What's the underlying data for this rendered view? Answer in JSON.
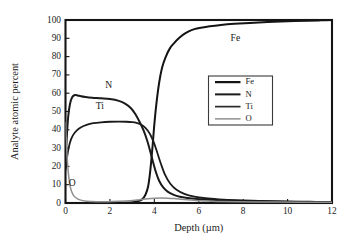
{
  "chart_data": {
    "type": "line",
    "title": "",
    "xlabel": "Depth (µm)",
    "ylabel": "Analyte atomic percent",
    "xlim": [
      0,
      12
    ],
    "ylim": [
      0,
      100
    ],
    "xticks": [
      0,
      2,
      4,
      6,
      8,
      10,
      12
    ],
    "yticks": [
      0,
      10,
      20,
      30,
      40,
      50,
      60,
      70,
      80,
      90,
      100
    ],
    "xtick_labels": [
      "0",
      "2",
      "4",
      "6",
      "8",
      "10",
      "12"
    ],
    "ytick_labels": [
      "0",
      "10",
      "20",
      "30",
      "40",
      "50",
      "60",
      "70",
      "80",
      "90",
      "100"
    ],
    "grid": false,
    "legend_position": "center-right",
    "legend_entries": [
      "Fe",
      "N",
      "Ti",
      "O"
    ],
    "annotations": [
      {
        "text": "Fe",
        "x": 7.65,
        "y": 88.5
      },
      {
        "text": "N",
        "x": 1.95,
        "y": 63.0
      },
      {
        "text": "Ti",
        "x": 1.55,
        "y": 51.5
      },
      {
        "text": "O",
        "x": 0.3,
        "y": 9.5
      }
    ],
    "series": [
      {
        "name": "Fe",
        "color": "#141414",
        "width": 2.0,
        "x": [
          0.0,
          0.1,
          0.25,
          0.5,
          0.9,
          1.4,
          2.0,
          2.5,
          2.9,
          3.2,
          3.45,
          3.6,
          3.72,
          3.82,
          3.92,
          4.0,
          4.1,
          4.22,
          4.35,
          4.5,
          4.7,
          4.9,
          5.1,
          5.3,
          5.55,
          5.8,
          6.1,
          6.5,
          7.0,
          7.6,
          8.3,
          9.1,
          10.0,
          10.9,
          11.5,
          12.0
        ],
        "y": [
          0.0,
          0.0,
          0.0,
          0.0,
          0.0,
          0.0,
          0.0,
          0.0,
          0.3,
          0.8,
          2.0,
          4.5,
          9.0,
          18.0,
          31.0,
          43.0,
          55.0,
          66.0,
          74.0,
          79.5,
          84.5,
          87.5,
          90.0,
          92.0,
          93.8,
          95.0,
          95.8,
          96.6,
          97.3,
          97.9,
          98.4,
          98.9,
          99.3,
          99.6,
          99.8,
          100.0
        ]
      },
      {
        "name": "N",
        "color": "#1a1a1a",
        "width": 2.0,
        "x": [
          0.0,
          0.05,
          0.12,
          0.2,
          0.3,
          0.42,
          0.55,
          0.7,
          0.9,
          1.2,
          1.6,
          2.0,
          2.4,
          2.7,
          2.95,
          3.15,
          3.35,
          3.52,
          3.68,
          3.82,
          3.95,
          4.08,
          4.22,
          4.4,
          4.6,
          4.85,
          5.15,
          5.5,
          5.9,
          6.4,
          7.0,
          7.8,
          8.8,
          10.0,
          11.0,
          12.0
        ],
        "y": [
          19.5,
          34.0,
          47.0,
          54.0,
          57.8,
          59.0,
          58.8,
          58.3,
          57.9,
          57.5,
          57.2,
          56.8,
          55.8,
          54.2,
          51.8,
          48.5,
          44.0,
          39.5,
          34.0,
          28.0,
          22.0,
          16.5,
          12.0,
          8.5,
          6.2,
          4.6,
          3.4,
          2.7,
          2.2,
          1.8,
          1.4,
          1.1,
          0.9,
          0.7,
          0.5,
          0.4
        ]
      },
      {
        "name": "Ti",
        "color": "#1a1a1a",
        "width": 1.8,
        "x": [
          0.0,
          0.06,
          0.14,
          0.24,
          0.36,
          0.5,
          0.7,
          0.95,
          1.25,
          1.6,
          2.0,
          2.4,
          2.75,
          3.0,
          3.2,
          3.38,
          3.55,
          3.7,
          3.85,
          3.98,
          4.12,
          4.28,
          4.48,
          4.72,
          5.0,
          5.35,
          5.8,
          6.3,
          6.9,
          7.7,
          8.7,
          9.8,
          11.0,
          12.0
        ],
        "y": [
          18.0,
          24.0,
          30.0,
          34.5,
          37.5,
          39.6,
          41.4,
          42.7,
          43.6,
          44.1,
          44.4,
          44.5,
          44.4,
          44.2,
          43.8,
          43.0,
          41.6,
          39.6,
          36.6,
          33.0,
          28.0,
          22.0,
          15.5,
          10.5,
          7.2,
          5.0,
          3.5,
          2.6,
          2.0,
          1.5,
          1.2,
          0.9,
          0.7,
          0.5
        ]
      },
      {
        "name": "O",
        "color": "#8e8e8e",
        "width": 1.5,
        "x": [
          0.0,
          0.04,
          0.09,
          0.15,
          0.22,
          0.32,
          0.45,
          0.65,
          0.95,
          1.4,
          1.9,
          2.4,
          2.9,
          3.3,
          3.7,
          4.0,
          4.3,
          4.6,
          4.9,
          5.2,
          5.5,
          5.8,
          6.1,
          6.5,
          7.0,
          7.7,
          8.6,
          9.6,
          10.7,
          12.0
        ],
        "y": [
          44.0,
          33.0,
          22.0,
          14.0,
          8.5,
          5.0,
          3.0,
          1.7,
          1.0,
          0.7,
          0.7,
          0.9,
          1.2,
          1.7,
          2.3,
          2.6,
          2.7,
          2.6,
          2.4,
          2.1,
          1.8,
          1.5,
          1.2,
          1.0,
          0.8,
          0.7,
          0.6,
          0.5,
          0.4,
          0.4
        ]
      }
    ]
  },
  "legend": {
    "items": [
      {
        "label": "Fe",
        "color": "#141414",
        "width": 2.2
      },
      {
        "label": "N",
        "color": "#1a1a1a",
        "width": 2.0
      },
      {
        "label": "Ti",
        "color": "#2a2a2a",
        "width": 1.7
      },
      {
        "label": "O",
        "color": "#909090",
        "width": 1.5
      }
    ]
  }
}
